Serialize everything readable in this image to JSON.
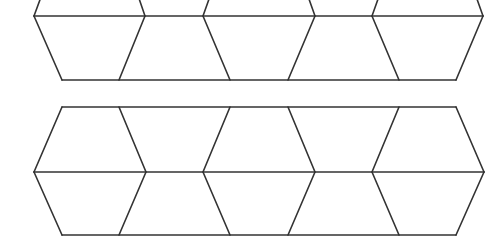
{
  "figure": {
    "width": 497,
    "height": 243,
    "background": "#ffffff",
    "stroke_color": "#333333",
    "stroke_width": 1.6
  },
  "strips": [
    {
      "name": "top-strip",
      "midline_y": 16,
      "top_y": -60,
      "bottom_y": 80,
      "hexagons": [
        {
          "left": 34,
          "right": 145,
          "inner_left": 62,
          "inner_right": 119
        },
        {
          "left": 203,
          "right": 315,
          "inner_left": 230,
          "inner_right": 288
        },
        {
          "left": 372,
          "right": 483,
          "inner_left": 399,
          "inner_right": 456
        }
      ]
    },
    {
      "name": "bottom-strip",
      "midline_y": 172,
      "top_y": 107,
      "bottom_y": 235,
      "hexagons": [
        {
          "left": 34,
          "right": 146,
          "inner_left": 62,
          "inner_right": 119
        },
        {
          "left": 203,
          "right": 315,
          "inner_left": 230,
          "inner_right": 288
        },
        {
          "left": 372,
          "right": 484,
          "inner_left": 399,
          "inner_right": 456
        }
      ]
    }
  ]
}
